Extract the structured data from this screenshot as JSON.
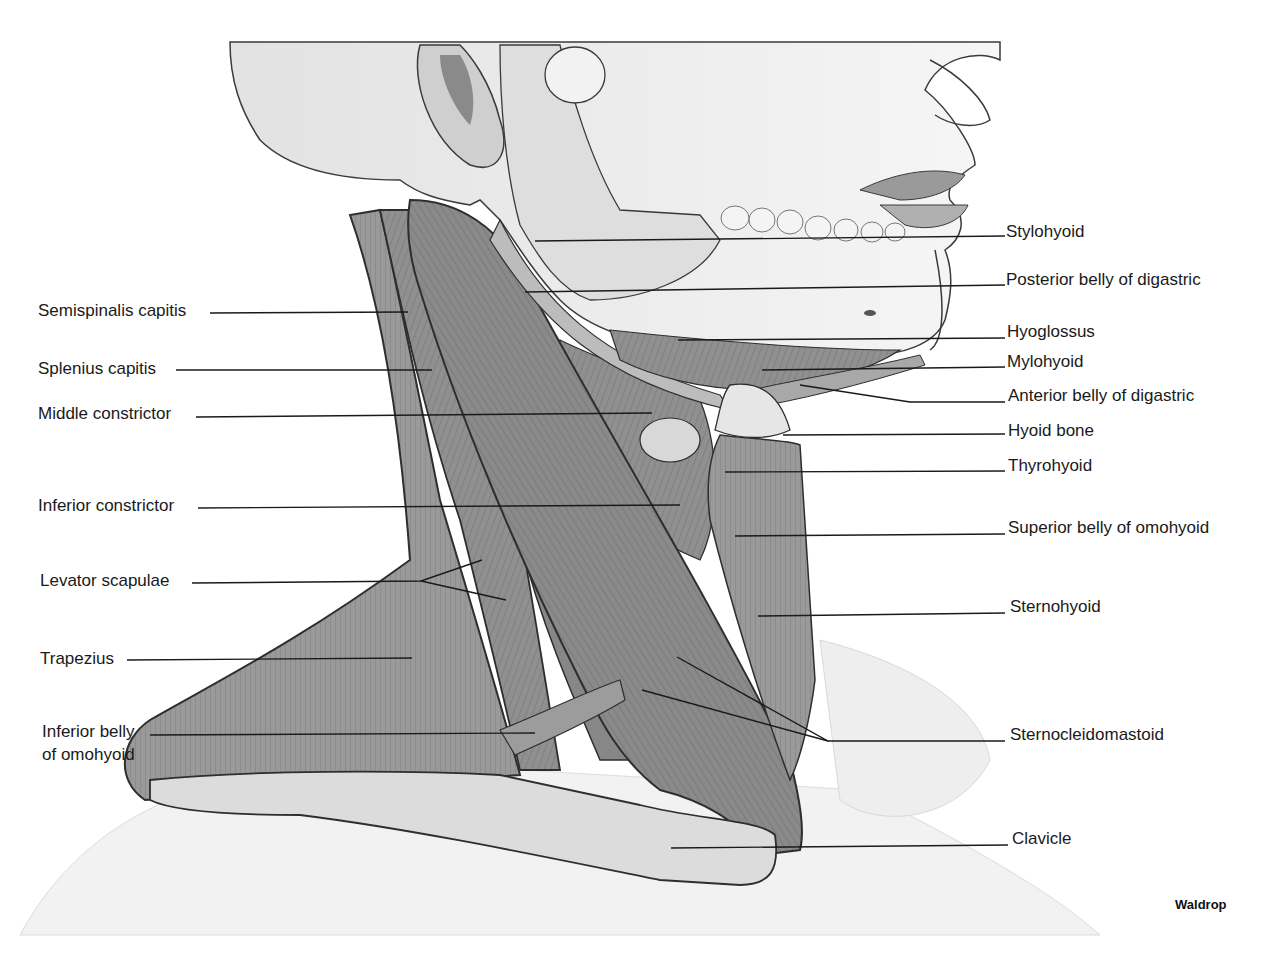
{
  "figure": {
    "credit": "Waldrop",
    "colors": {
      "muscle": "#8c8c8c",
      "muscle_dark": "#5e5e5e",
      "muscle_light": "#b4b4b4",
      "bone": "#d6d6d6",
      "skin": "#ececec",
      "outline": "#2e2e2e",
      "leader": "#1a1a1a"
    }
  },
  "labels_left": [
    {
      "text": "Semispinalis capitis",
      "x": 38,
      "y": 300
    },
    {
      "text": "Splenius capitis",
      "x": 38,
      "y": 359
    },
    {
      "text": "Middle constrictor",
      "x": 38,
      "y": 404
    },
    {
      "text": "Inferior constrictor",
      "x": 38,
      "y": 496
    },
    {
      "text": "Levator scapulae",
      "x": 40,
      "y": 571
    },
    {
      "text": "Trapezius",
      "x": 40,
      "y": 649
    },
    {
      "text": "Inferior belly",
      "x": 42,
      "y": 722
    },
    {
      "text": "of omohyoid",
      "x": 42,
      "y": 745
    }
  ],
  "labels_right": [
    {
      "text": "Stylohyoid",
      "x": 1006,
      "y": 222
    },
    {
      "text": "Posterior belly of digastric",
      "x": 1006,
      "y": 270
    },
    {
      "text": "Hyoglossus",
      "x": 1007,
      "y": 322
    },
    {
      "text": "Mylohyoid",
      "x": 1007,
      "y": 352
    },
    {
      "text": "Anterior belly of digastric",
      "x": 1008,
      "y": 386
    },
    {
      "text": "Hyoid bone",
      "x": 1008,
      "y": 421
    },
    {
      "text": "Thyrohyoid",
      "x": 1008,
      "y": 456
    },
    {
      "text": "Superior belly of omohyoid",
      "x": 1008,
      "y": 518
    },
    {
      "text": "Sternohyoid",
      "x": 1010,
      "y": 597
    },
    {
      "text": "Sternocleidomastoid",
      "x": 1010,
      "y": 725
    },
    {
      "text": "Clavicle",
      "x": 1012,
      "y": 829
    }
  ]
}
